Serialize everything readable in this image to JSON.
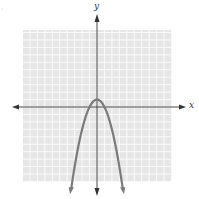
{
  "chart_data": {
    "type": "line",
    "title": "",
    "xlabel": "x",
    "ylabel": "y",
    "equation": "y = -x^2 + 1",
    "xlim": [
      -10,
      10
    ],
    "ylim": [
      -10,
      10
    ],
    "grid": true,
    "legend": null,
    "series": [
      {
        "name": "parabola",
        "x": [
          -3.5,
          -3,
          -2,
          -1,
          0,
          1,
          2,
          3,
          3.5
        ],
        "y": [
          -11.25,
          -8,
          -3,
          0,
          1,
          0,
          -3,
          -8,
          -11.25
        ]
      }
    ],
    "vertex": [
      0,
      1
    ],
    "x_intercepts": [
      -1,
      1
    ],
    "colors": {
      "curve": "#7a7a7a",
      "grid_bg": "#e6e6e6",
      "grid_line": "#ffffff",
      "axis": "#333333"
    }
  },
  "labels": {
    "x_axis": "x",
    "y_axis": "y",
    "corner_mark": "·"
  }
}
